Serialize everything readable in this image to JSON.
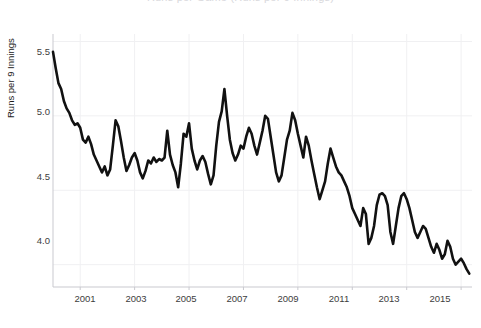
{
  "chart_data": {
    "type": "line",
    "title": "Runs per Game (Runs per 9 Innings)",
    "xlabel": "",
    "ylabel": "Runs per 9 Innings",
    "xlim": [
      2000.0,
      2015.4
    ],
    "ylim": [
      3.85,
      5.55
    ],
    "yticks": [
      5.5,
      5.0,
      4.5,
      4.0
    ],
    "ytick_labels": [
      "5.5",
      "5.0",
      "4.5",
      "4.0"
    ],
    "xticks": [
      2001,
      2003,
      2005,
      2007,
      2009,
      2011,
      2013,
      2015
    ],
    "xtick_labels": [
      "2001",
      "2003",
      "2005",
      "2007",
      "2009",
      "2011",
      "2013",
      "2015"
    ],
    "grid": true,
    "legend": false,
    "line_color": "#111111",
    "line_width": 2.6,
    "series": [
      {
        "name": "Runs per 9 Innings",
        "x": [
          2000.0,
          2000.1,
          2000.2,
          2000.3,
          2000.4,
          2000.5,
          2000.6,
          2000.7,
          2000.8,
          2000.9,
          2001.0,
          2001.1,
          2001.2,
          2001.3,
          2001.4,
          2001.5,
          2001.6,
          2001.7,
          2001.8,
          2001.9,
          2002.0,
          2002.1,
          2002.2,
          2002.3,
          2002.4,
          2002.5,
          2002.6,
          2002.7,
          2002.8,
          2002.9,
          2003.0,
          2003.1,
          2003.2,
          2003.3,
          2003.4,
          2003.5,
          2003.6,
          2003.7,
          2003.8,
          2003.9,
          2004.0,
          2004.1,
          2004.2,
          2004.3,
          2004.4,
          2004.5,
          2004.6,
          2004.7,
          2004.8,
          2004.9,
          2005.0,
          2005.1,
          2005.2,
          2005.3,
          2005.4,
          2005.5,
          2005.6,
          2005.7,
          2005.8,
          2005.9,
          2006.0,
          2006.1,
          2006.2,
          2006.3,
          2006.4,
          2006.5,
          2006.6,
          2006.7,
          2006.8,
          2006.9,
          2007.0,
          2007.1,
          2007.2,
          2007.3,
          2007.4,
          2007.5,
          2007.6,
          2007.7,
          2007.8,
          2007.9,
          2008.0,
          2008.1,
          2008.2,
          2008.3,
          2008.4,
          2008.5,
          2008.6,
          2008.7,
          2008.8,
          2008.9,
          2009.0,
          2009.1,
          2009.2,
          2009.3,
          2009.4,
          2009.5,
          2009.6,
          2009.7,
          2009.8,
          2009.9,
          2010.0,
          2010.1,
          2010.2,
          2010.3,
          2010.4,
          2010.5,
          2010.6,
          2010.7,
          2010.8,
          2010.9,
          2011.0,
          2011.1,
          2011.2,
          2011.3,
          2011.4,
          2011.5,
          2011.6,
          2011.7,
          2011.8,
          2011.9,
          2012.0,
          2012.1,
          2012.2,
          2012.3,
          2012.4,
          2012.5,
          2012.6,
          2012.7,
          2012.8,
          2012.9,
          2013.0,
          2013.1,
          2013.2,
          2013.3,
          2013.4,
          2013.5,
          2013.6,
          2013.7,
          2013.8,
          2013.9,
          2014.0,
          2014.1,
          2014.2,
          2014.3,
          2014.4,
          2014.5,
          2014.6,
          2014.7,
          2014.8,
          2014.9,
          2015.0,
          2015.1,
          2015.2,
          2015.3
        ],
        "values": [
          5.43,
          5.32,
          5.22,
          5.18,
          5.1,
          5.05,
          5.02,
          4.97,
          4.94,
          4.95,
          4.92,
          4.84,
          4.82,
          4.86,
          4.81,
          4.74,
          4.7,
          4.66,
          4.62,
          4.66,
          4.6,
          4.64,
          4.8,
          4.97,
          4.93,
          4.83,
          4.72,
          4.63,
          4.67,
          4.72,
          4.75,
          4.7,
          4.62,
          4.58,
          4.63,
          4.7,
          4.68,
          4.72,
          4.69,
          4.71,
          4.7,
          4.72,
          4.9,
          4.74,
          4.67,
          4.62,
          4.52,
          4.68,
          4.88,
          4.86,
          4.95,
          4.78,
          4.7,
          4.64,
          4.7,
          4.73,
          4.69,
          4.61,
          4.54,
          4.6,
          4.8,
          4.96,
          5.03,
          5.18,
          5.0,
          4.84,
          4.75,
          4.7,
          4.74,
          4.8,
          4.78,
          4.86,
          4.92,
          4.88,
          4.8,
          4.74,
          4.82,
          4.9,
          5.0,
          4.98,
          4.86,
          4.74,
          4.62,
          4.56,
          4.6,
          4.72,
          4.84,
          4.9,
          5.02,
          4.97,
          4.88,
          4.8,
          4.72,
          4.86,
          4.8,
          4.7,
          4.61,
          4.52,
          4.44,
          4.5,
          4.56,
          4.68,
          4.78,
          4.72,
          4.66,
          4.62,
          4.6,
          4.56,
          4.52,
          4.46,
          4.38,
          4.34,
          4.3,
          4.26,
          4.38,
          4.34,
          4.14,
          4.18,
          4.26,
          4.4,
          4.47,
          4.48,
          4.46,
          4.4,
          4.22,
          4.14,
          4.26,
          4.38,
          4.46,
          4.48,
          4.44,
          4.38,
          4.3,
          4.22,
          4.18,
          4.22,
          4.26,
          4.24,
          4.18,
          4.12,
          4.08,
          4.14,
          4.1,
          4.04,
          4.07,
          4.16,
          4.12,
          4.04,
          4.0,
          4.02,
          4.04,
          4.01,
          3.97,
          3.94
        ]
      }
    ]
  },
  "axis": {
    "y_axis_title": "Runs per 9 Innings",
    "y_tick_0": "5.5",
    "y_tick_1": "5.0",
    "y_tick_2": "4.5",
    "y_tick_3": "4.0",
    "x_tick_0": "2001",
    "x_tick_1": "2003",
    "x_tick_2": "2005",
    "x_tick_3": "2007",
    "x_tick_4": "2009",
    "x_tick_5": "2011",
    "x_tick_6": "2013",
    "x_tick_7": "2015"
  },
  "title_fragment": "Runs per Game (Runs per 9 Innings)",
  "colors": {
    "line": "#111111",
    "grid": "#f0f0f2",
    "axis": "#c9c9cf",
    "tick_text": "#3d3d3d"
  }
}
